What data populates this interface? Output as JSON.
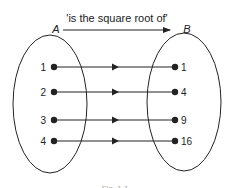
{
  "diagram": {
    "relation_label": "'is the square root of'",
    "set_a_label": "A",
    "set_b_label": "B",
    "caption": "Fig. 1.1",
    "mappings": [
      {
        "from": "1",
        "to": "1"
      },
      {
        "from": "2",
        "to": "4"
      },
      {
        "from": "3",
        "to": "9"
      },
      {
        "from": "4",
        "to": "16"
      }
    ],
    "colors": {
      "ink": "#222222",
      "background": "#ffffff"
    }
  }
}
